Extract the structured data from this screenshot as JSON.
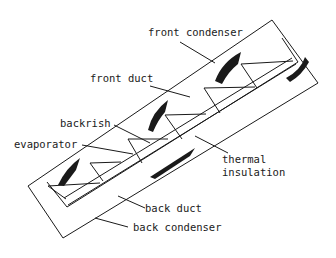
{
  "diagram": {
    "labels": {
      "front_condenser": "front condenser",
      "front_duct": "front duct",
      "backrish": "backrish",
      "evaporator": "evaporator",
      "thermal": "thermal",
      "insulation": "insulation",
      "back_duct": "back duct",
      "back_condenser": "back condenser"
    },
    "colors": {
      "line": "#1a1a1a",
      "background": "#ffffff"
    }
  }
}
